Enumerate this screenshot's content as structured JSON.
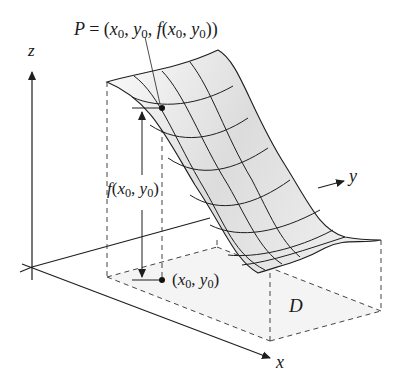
{
  "figure": {
    "type": "3D surface over domain diagram",
    "axes": {
      "z_label": "z",
      "y_label": "y",
      "x_label": "x"
    },
    "labels": {
      "point_P": {
        "name": "P",
        "equals": "=",
        "open": "(",
        "x": "x",
        "x_sub": "0",
        "sep1": ",",
        "y": "y",
        "y_sub": "0",
        "sep2": ",",
        "f": "f",
        "inner_open": "(",
        "fx": "x",
        "fx_sub": "0",
        "sep3": ",",
        "fy": "y",
        "fy_sub": "0",
        "close": "))"
      },
      "height": {
        "f": "f",
        "open": "(",
        "x": "x",
        "x_sub": "0",
        "sep": ",",
        "y": "y",
        "y_sub": "0",
        "close": ")"
      },
      "base_point": {
        "open": "(",
        "x": "x",
        "x_sub": "0",
        "sep": ",",
        "y": "y",
        "y_sub": "0",
        "close": ")"
      },
      "domain": "D"
    },
    "colors": {
      "line": "#1e1e1e",
      "dashed": "#444444",
      "surface_light": "#f6f6f6",
      "surface_dark": "#d4d4d4"
    }
  }
}
